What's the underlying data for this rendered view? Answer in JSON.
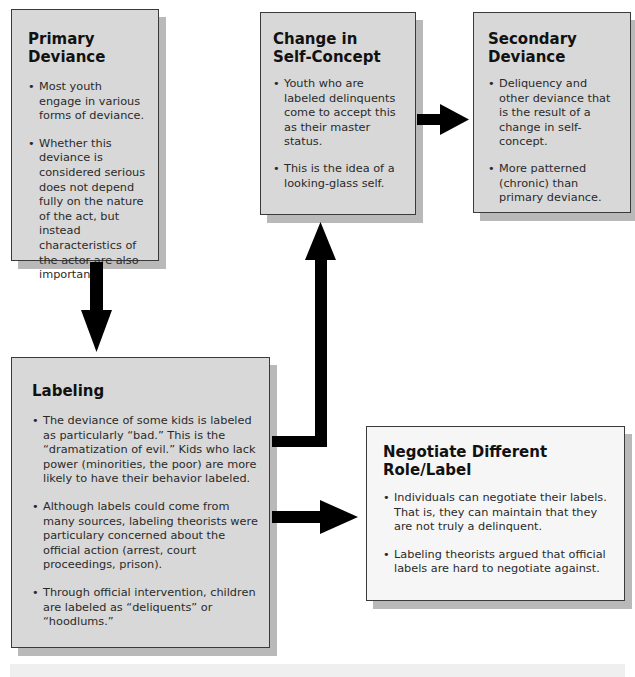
{
  "diagram": {
    "boxes": {
      "primary": {
        "title": "Primary Deviance",
        "bullets": [
          "Most youth engage in various forms of deviance.",
          "Whether this deviance is considered serious does not depend fully on the nature of the act, but instead characteristics of the actor are also important."
        ]
      },
      "change": {
        "title_line1": "Change in",
        "title_line2": "Self-Concept",
        "bullets": [
          "Youth who are labeled delinquents come to accept this as their master status.",
          "This is the idea of a looking-glass self."
        ]
      },
      "secondary": {
        "title_line1": "Secondary",
        "title_line2": "Deviance",
        "bullets": [
          "Deliquency and other deviance that is the result of a change in self-concept.",
          "More patterned (chronic) than primary deviance."
        ]
      },
      "labeling": {
        "title": "Labeling",
        "bullets": [
          "The deviance of some kids is labeled as particularly “bad.” This is the “dramatization of evil.” Kids who lack power (minorities, the poor) are more likely to have their behavior labeled.",
          "Although labels could come from many sources, labeling theorists were particulary concerned about the official action (arrest, court proceedings, prison).",
          "Through official intervention, children are labeled as “deliquents” or “hoodlums.”"
        ]
      },
      "negotiate": {
        "title": "Negotiate Different Role/Label",
        "bullets": [
          "Individuals can negotiate their labels. That is, they can maintain that they are not truly a delinquent.",
          "Labeling theorists argued that official labels are hard to negotiate against."
        ]
      }
    },
    "connections": [
      {
        "from": "Primary Deviance",
        "to": "Labeling"
      },
      {
        "from": "Labeling",
        "to": "Change in Self-Concept"
      },
      {
        "from": "Change in Self-Concept",
        "to": "Secondary Deviance"
      },
      {
        "from": "Labeling",
        "to": "Negotiate Different Role/Label"
      }
    ],
    "colors": {
      "box_fill": "#d8d8d8",
      "box_fill_light": "#f6f6f6",
      "border": "#3a3a3a",
      "shadow": "#b9b9b9",
      "arrow": "#000000"
    }
  }
}
